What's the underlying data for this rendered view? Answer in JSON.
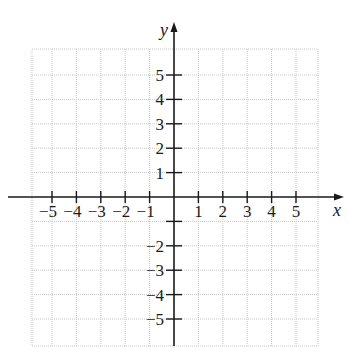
{
  "chart_data": {
    "type": "coordinate-grid",
    "title": "",
    "xlabel": "x",
    "ylabel": "y",
    "xlim": [
      -6,
      6
    ],
    "ylim": [
      -6,
      6
    ],
    "grid": true,
    "grid_style": "dotted",
    "x_ticks": [
      -5,
      -4,
      -3,
      -2,
      -1,
      1,
      2,
      3,
      4,
      5
    ],
    "x_tick_labels": [
      "−5",
      "−4",
      "−3",
      "−2",
      "−1",
      "1",
      "2",
      "3",
      "4",
      "5"
    ],
    "y_ticks": [
      5,
      4,
      3,
      2,
      1,
      -1,
      -2,
      -3,
      -4,
      -5
    ],
    "y_tick_labels": [
      "5",
      "4",
      "3",
      "2",
      "1",
      "",
      "−2",
      "−3",
      "−4",
      "−5"
    ],
    "series": []
  },
  "axes": {
    "x_label": "x",
    "y_label": "y"
  },
  "colors": {
    "axis": "#1a1a1a",
    "grid": "#c8c8c8",
    "background": "#ffffff"
  }
}
